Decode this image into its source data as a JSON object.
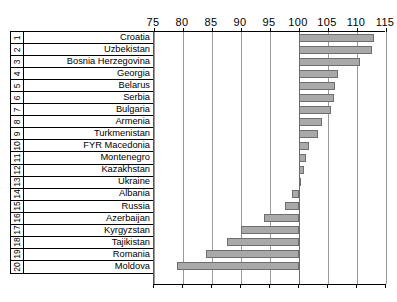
{
  "chart_data": {
    "type": "bar",
    "orientation": "horizontal",
    "title": "",
    "xlabel": "",
    "ylabel": "",
    "xlim": [
      75,
      115
    ],
    "baseline": 100,
    "grid": true,
    "legend": "none",
    "ticks": [
      75,
      80,
      85,
      90,
      95,
      100,
      105,
      110,
      115
    ],
    "tick_labels": [
      "75",
      "80",
      "85",
      "90",
      "95",
      "100",
      "105",
      "110",
      "115"
    ],
    "categories": [
      "Croatia",
      "Uzbekistan",
      "Bosnia Herzegovina",
      "Georgia",
      "Belarus",
      "Serbia",
      "Bulgaria",
      "Armenia",
      "Turkmenistan",
      "FYR Macedonia",
      "Montenegro",
      "Kazakhstan",
      "Ukraine",
      "Albania",
      "Russia",
      "Azerbaijan",
      "Kyrgyzstan",
      "Tajikistan",
      "Romania",
      "Moldova"
    ],
    "ranks": [
      "1",
      "2",
      "3",
      "4",
      "5",
      "6",
      "7",
      "8",
      "9",
      "10",
      "11",
      "12",
      "13",
      "14",
      "15",
      "16",
      "17",
      "18",
      "19",
      "20"
    ],
    "values": [
      113.0,
      112.6,
      110.6,
      106.7,
      106.2,
      106.0,
      105.6,
      104.0,
      103.2,
      101.7,
      101.2,
      100.9,
      100.3,
      98.8,
      97.6,
      94.0,
      90.0,
      87.6,
      84.0,
      79.0
    ]
  },
  "colors": {
    "bar_fill": "#a9a9a9",
    "bar_stroke": "#6e6e6e",
    "gridline": "#9a9a9a",
    "axis": "#000000",
    "background": "#ffffff"
  }
}
